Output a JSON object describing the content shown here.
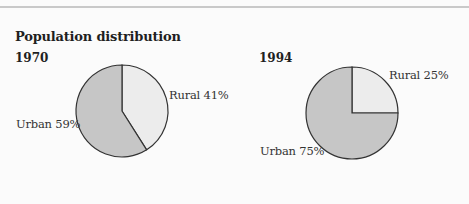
{
  "title": "Population distribution",
  "colors": {
    "urban": "#c6c6c6",
    "rural": "#ececec",
    "stroke": "#333333"
  },
  "chart_data": [
    {
      "type": "pie",
      "title": "1970",
      "slices": [
        {
          "label": "Rural",
          "value": 41,
          "text": "Rural 41%"
        },
        {
          "label": "Urban",
          "value": 59,
          "text": "Urban 59%"
        }
      ]
    },
    {
      "type": "pie",
      "title": "1994",
      "slices": [
        {
          "label": "Rural",
          "value": 25,
          "text": "Rural 25%"
        },
        {
          "label": "Urban",
          "value": 75,
          "text": "Urban 75%"
        }
      ]
    }
  ]
}
